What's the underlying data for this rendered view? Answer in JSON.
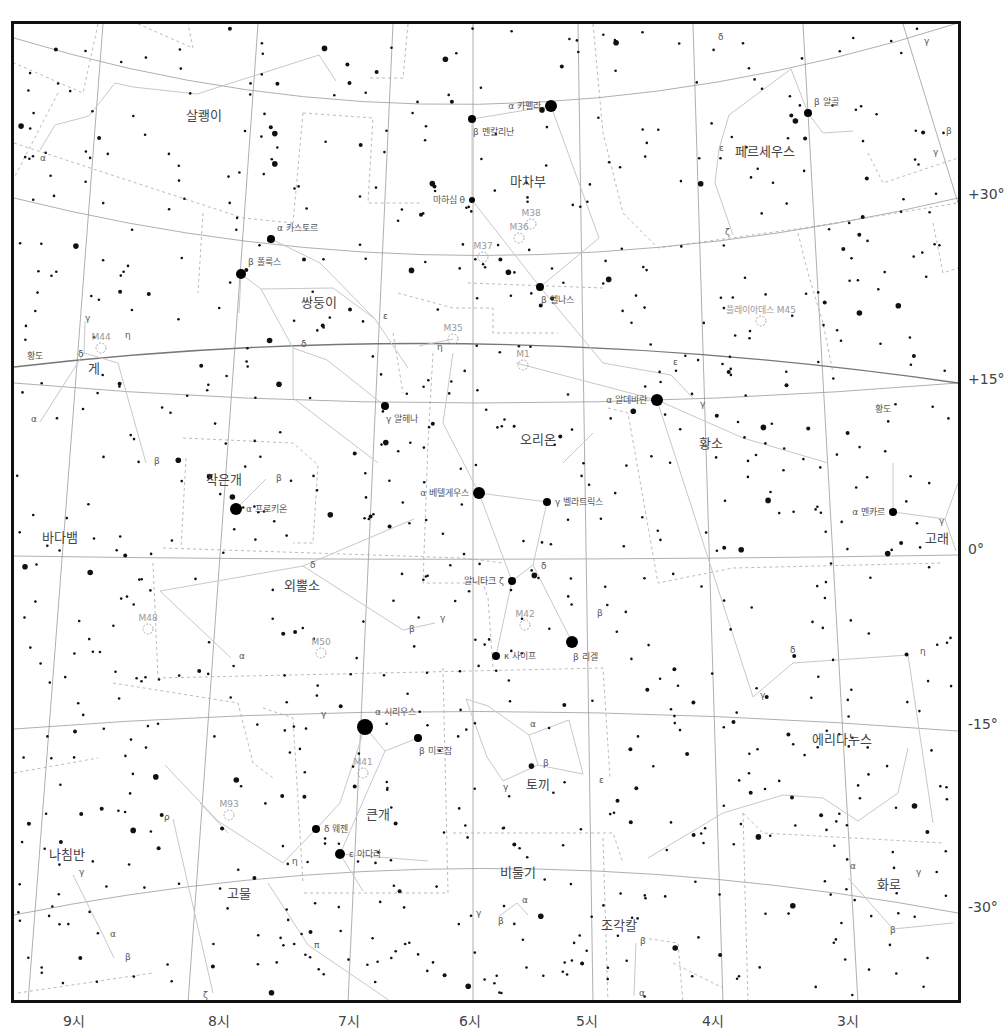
{
  "chart": {
    "declination_labels": [
      {
        "text": "+30°",
        "y": 195
      },
      {
        "text": "+15°",
        "y": 380
      },
      {
        "text": "0°",
        "y": 550
      },
      {
        "text": "-15°",
        "y": 725
      },
      {
        "text": "-30°",
        "y": 908
      }
    ],
    "ra_labels": [
      {
        "text": "9시",
        "x": 74
      },
      {
        "text": "8시",
        "x": 219
      },
      {
        "text": "7시",
        "x": 349
      },
      {
        "text": "6시",
        "x": 470
      },
      {
        "text": "5시",
        "x": 587
      },
      {
        "text": "4시",
        "x": 713
      },
      {
        "text": "3시",
        "x": 848
      }
    ],
    "ecliptic_label": "황도",
    "constellations": [
      {
        "name": "살쾡이",
        "x": 201,
        "y": 117
      },
      {
        "name": "마차부",
        "x": 525,
        "y": 183
      },
      {
        "name": "페르세우스",
        "x": 762,
        "y": 153
      },
      {
        "name": "쌍둥이",
        "x": 316,
        "y": 304
      },
      {
        "name": "게",
        "x": 91,
        "y": 370
      },
      {
        "name": "작은개",
        "x": 221,
        "y": 481
      },
      {
        "name": "오리온",
        "x": 535,
        "y": 441
      },
      {
        "name": "황소",
        "x": 708,
        "y": 445
      },
      {
        "name": "바다뱀",
        "x": 57,
        "y": 539
      },
      {
        "name": "외뿔소",
        "x": 299,
        "y": 587
      },
      {
        "name": "고래",
        "x": 934,
        "y": 540
      },
      {
        "name": "에리다누스",
        "x": 839,
        "y": 741
      },
      {
        "name": "토끼",
        "x": 535,
        "y": 786
      },
      {
        "name": "큰개",
        "x": 375,
        "y": 816
      },
      {
        "name": "나침반",
        "x": 64,
        "y": 856
      },
      {
        "name": "고물",
        "x": 236,
        "y": 895
      },
      {
        "name": "비둘기",
        "x": 515,
        "y": 874
      },
      {
        "name": "화로",
        "x": 886,
        "y": 886
      },
      {
        "name": "조각칼",
        "x": 616,
        "y": 927
      }
    ],
    "named_stars": [
      {
        "name": "카펠라",
        "greek": "α",
        "x": 548,
        "y": 103,
        "r": 6,
        "label_side": "left"
      },
      {
        "name": "멘칼리난",
        "greek": "β",
        "x": 469,
        "y": 116,
        "r": 4,
        "label_side": "below"
      },
      {
        "name": "마하심 θ",
        "greek": "",
        "x": 469,
        "y": 197,
        "r": 3,
        "label_side": "left"
      },
      {
        "name": "알골",
        "greek": "β",
        "x": 805,
        "y": 110,
        "r": 4,
        "label_side": "above"
      },
      {
        "name": "카스토르",
        "greek": "α",
        "x": 268,
        "y": 236,
        "r": 4,
        "label_side": "above"
      },
      {
        "name": "폴룩스",
        "greek": "β",
        "x": 238,
        "y": 271,
        "r": 5,
        "label_side": "above"
      },
      {
        "name": "엘나스",
        "greek": "β",
        "x": 537,
        "y": 284,
        "r": 4,
        "label_side": "below"
      },
      {
        "name": "알헤나",
        "greek": "γ",
        "x": 382,
        "y": 403,
        "r": 4,
        "label_side": "below"
      },
      {
        "name": "알데바란",
        "greek": "α",
        "x": 654,
        "y": 397,
        "r": 6,
        "label_side": "left"
      },
      {
        "name": "베텔게우스",
        "greek": "α",
        "x": 476,
        "y": 490,
        "r": 6,
        "label_side": "left"
      },
      {
        "name": "벨라트릭스",
        "greek": "γ",
        "x": 544,
        "y": 499,
        "r": 4,
        "label_side": "right"
      },
      {
        "name": "프로키온",
        "greek": "α",
        "x": 233,
        "y": 506,
        "r": 6,
        "label_side": "right"
      },
      {
        "name": "멘카르",
        "greek": "α",
        "x": 890,
        "y": 509,
        "r": 4,
        "label_side": "left"
      },
      {
        "name": "알니타크 ζ",
        "greek": "",
        "x": 509,
        "y": 578,
        "r": 4,
        "label_side": "left"
      },
      {
        "name": "리겔",
        "greek": "β",
        "x": 569,
        "y": 639,
        "r": 6,
        "label_side": "below"
      },
      {
        "name": "사이프",
        "greek": "κ",
        "x": 493,
        "y": 653,
        "r": 4,
        "label_side": "right"
      },
      {
        "name": "시리우스",
        "greek": "α",
        "x": 362,
        "y": 724,
        "r": 8,
        "label_side": "above"
      },
      {
        "name": "미르잠",
        "greek": "β",
        "x": 415,
        "y": 735,
        "r": 4,
        "label_side": "below"
      },
      {
        "name": "웨젠",
        "greek": "δ",
        "x": 313,
        "y": 826,
        "r": 4,
        "label_side": "right"
      },
      {
        "name": "아다라",
        "greek": "ε",
        "x": 337,
        "y": 851,
        "r": 5,
        "label_side": "right"
      }
    ],
    "deep_sky": [
      {
        "name": "M44",
        "x": 98,
        "y": 337
      },
      {
        "name": "M35",
        "x": 450,
        "y": 328
      },
      {
        "name": "M38",
        "x": 528,
        "y": 213
      },
      {
        "name": "M36",
        "x": 516,
        "y": 227
      },
      {
        "name": "M37",
        "x": 480,
        "y": 246
      },
      {
        "name": "M1",
        "x": 520,
        "y": 354
      },
      {
        "name": "플레이아데스 M45",
        "x": 758,
        "y": 310
      },
      {
        "name": "M42",
        "x": 522,
        "y": 614
      },
      {
        "name": "M48",
        "x": 145,
        "y": 618
      },
      {
        "name": "M50",
        "x": 318,
        "y": 642
      },
      {
        "name": "M41",
        "x": 360,
        "y": 762
      },
      {
        "name": "M93",
        "x": 226,
        "y": 804
      }
    ],
    "greek_labels": [
      {
        "t": "α",
        "x": 37,
        "y": 158
      },
      {
        "t": "δ",
        "x": 715,
        "y": 37
      },
      {
        "t": "ε",
        "x": 716,
        "y": 148
      },
      {
        "t": "ζ",
        "x": 722,
        "y": 232
      },
      {
        "t": "γ",
        "x": 921,
        "y": 41
      },
      {
        "t": "β",
        "x": 943,
        "y": 131
      },
      {
        "t": "γ",
        "x": 930,
        "y": 152
      },
      {
        "t": "γ",
        "x": 82,
        "y": 318
      },
      {
        "t": "η",
        "x": 122,
        "y": 335
      },
      {
        "t": "δ",
        "x": 75,
        "y": 354
      },
      {
        "t": "α",
        "x": 28,
        "y": 419
      },
      {
        "t": "β",
        "x": 151,
        "y": 461
      },
      {
        "t": "β",
        "x": 273,
        "y": 478
      },
      {
        "t": "δ",
        "x": 298,
        "y": 344
      },
      {
        "t": "ε",
        "x": 380,
        "y": 316
      },
      {
        "t": "η",
        "x": 434,
        "y": 347
      },
      {
        "t": "ε",
        "x": 670,
        "y": 362
      },
      {
        "t": "γ",
        "x": 697,
        "y": 404
      },
      {
        "t": "δ",
        "x": 538,
        "y": 566
      },
      {
        "t": "β",
        "x": 594,
        "y": 613
      },
      {
        "t": "δ",
        "x": 307,
        "y": 565
      },
      {
        "t": "β",
        "x": 406,
        "y": 629
      },
      {
        "t": "γ",
        "x": 437,
        "y": 618
      },
      {
        "t": "α",
        "x": 236,
        "y": 656
      },
      {
        "t": "γ",
        "x": 757,
        "y": 695
      },
      {
        "t": "δ",
        "x": 787,
        "y": 650
      },
      {
        "t": "η",
        "x": 917,
        "y": 651
      },
      {
        "t": "γ",
        "x": 936,
        "y": 521
      },
      {
        "t": "γ",
        "x": 318,
        "y": 714
      },
      {
        "t": "α",
        "x": 527,
        "y": 724
      },
      {
        "t": "β",
        "x": 540,
        "y": 763
      },
      {
        "t": "γ",
        "x": 500,
        "y": 787
      },
      {
        "t": "ε",
        "x": 596,
        "y": 780
      },
      {
        "t": "ρ",
        "x": 161,
        "y": 817
      },
      {
        "t": "η",
        "x": 289,
        "y": 861
      },
      {
        "t": "γ",
        "x": 76,
        "y": 872
      },
      {
        "t": "α",
        "x": 107,
        "y": 934
      },
      {
        "t": "β",
        "x": 122,
        "y": 957
      },
      {
        "t": "π",
        "x": 311,
        "y": 945
      },
      {
        "t": "ζ",
        "x": 200,
        "y": 995
      },
      {
        "t": "α",
        "x": 519,
        "y": 900
      },
      {
        "t": "γ",
        "x": 473,
        "y": 913
      },
      {
        "t": "β",
        "x": 495,
        "y": 921
      },
      {
        "t": "β",
        "x": 637,
        "y": 941
      },
      {
        "t": "α",
        "x": 636,
        "y": 993
      },
      {
        "t": "α",
        "x": 847,
        "y": 866
      },
      {
        "t": "γ",
        "x": 913,
        "y": 872
      },
      {
        "t": "β",
        "x": 887,
        "y": 930
      }
    ]
  }
}
